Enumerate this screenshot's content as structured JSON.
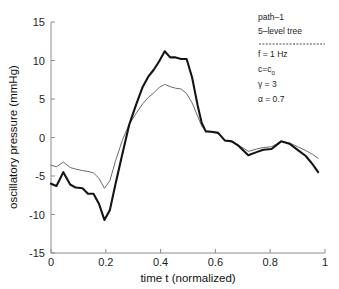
{
  "chart_data": {
    "type": "line",
    "title": "",
    "xlabel": "time t (normalized)",
    "ylabel": "oscillatory pressure (mmHg)",
    "xlim": [
      0,
      1
    ],
    "ylim": [
      -15,
      15
    ],
    "xticks": [
      "0",
      "0.2",
      "0.4",
      "0.6",
      "0.8",
      "1"
    ],
    "xtick_values": [
      0,
      0.2,
      0.4,
      0.6,
      0.8,
      1
    ],
    "yticks": [
      "15",
      "10",
      "5",
      "0",
      "-5",
      "-10",
      "-15"
    ],
    "ytick_values": [
      15,
      10,
      5,
      0,
      -5,
      -10,
      -15
    ],
    "grid": false,
    "legend_position": "top-right",
    "series": [
      {
        "name": "thick-line",
        "style": "thick-black",
        "x": [
          0.0,
          0.02,
          0.045,
          0.07,
          0.09,
          0.115,
          0.135,
          0.155,
          0.175,
          0.195,
          0.215,
          0.235,
          0.26,
          0.285,
          0.31,
          0.335,
          0.355,
          0.375,
          0.395,
          0.415,
          0.435,
          0.455,
          0.475,
          0.495,
          0.515,
          0.535,
          0.55,
          0.565,
          0.585,
          0.61,
          0.635,
          0.66,
          0.685,
          0.72,
          0.75,
          0.775,
          0.805,
          0.84,
          0.87,
          0.9,
          0.93,
          0.955,
          0.975
        ],
        "y": [
          -6.0,
          -6.3,
          -4.5,
          -6.1,
          -6.5,
          -6.6,
          -7.3,
          -7.3,
          -8.6,
          -10.7,
          -9.4,
          -6.1,
          -2.2,
          1.6,
          4.2,
          6.6,
          7.9,
          8.8,
          9.9,
          11.2,
          10.4,
          10.4,
          10.2,
          10.2,
          7.8,
          4.2,
          1.9,
          0.8,
          0.75,
          0.6,
          -0.4,
          -0.5,
          -1.1,
          -2.3,
          -1.9,
          -1.6,
          -1.5,
          -0.5,
          -0.8,
          -1.6,
          -2.4,
          -3.5,
          -4.5
        ]
      },
      {
        "name": "thin-line",
        "style": "thin-gray",
        "x": [
          0.0,
          0.02,
          0.045,
          0.07,
          0.09,
          0.115,
          0.135,
          0.155,
          0.175,
          0.195,
          0.215,
          0.235,
          0.26,
          0.285,
          0.31,
          0.335,
          0.355,
          0.375,
          0.395,
          0.415,
          0.435,
          0.455,
          0.475,
          0.495,
          0.515,
          0.535,
          0.55,
          0.565,
          0.585,
          0.61,
          0.635,
          0.66,
          0.685,
          0.72,
          0.75,
          0.775,
          0.805,
          0.84,
          0.87,
          0.9,
          0.93,
          0.955,
          0.975
        ],
        "y": [
          -3.6,
          -3.8,
          -3.2,
          -3.9,
          -4.1,
          -4.3,
          -4.4,
          -4.6,
          -5.3,
          -6.6,
          -5.6,
          -3.1,
          -0.4,
          1.7,
          3.1,
          4.4,
          5.2,
          5.8,
          6.5,
          6.9,
          6.6,
          6.4,
          6.3,
          5.7,
          4.5,
          2.8,
          1.5,
          0.8,
          0.75,
          0.6,
          -0.4,
          -0.5,
          -1.0,
          -1.8,
          -1.5,
          -1.3,
          -1.2,
          -0.5,
          -0.7,
          -1.2,
          -1.7,
          -2.2,
          -2.7
        ]
      }
    ],
    "annotations": [
      {
        "text": "path–1"
      },
      {
        "text": "5–level tree"
      },
      {
        "text": "f = 1 Hz"
      },
      {
        "text": "c=c",
        "subscript": "0"
      },
      {
        "text": "γ = 3"
      },
      {
        "text": "α = 0.7"
      }
    ]
  },
  "colors": {
    "thick_line": "#141414",
    "thin_line": "#6b6b6b",
    "axis": "#8c8c8c",
    "text": "#1d1d1d",
    "background": "#ffffff"
  }
}
